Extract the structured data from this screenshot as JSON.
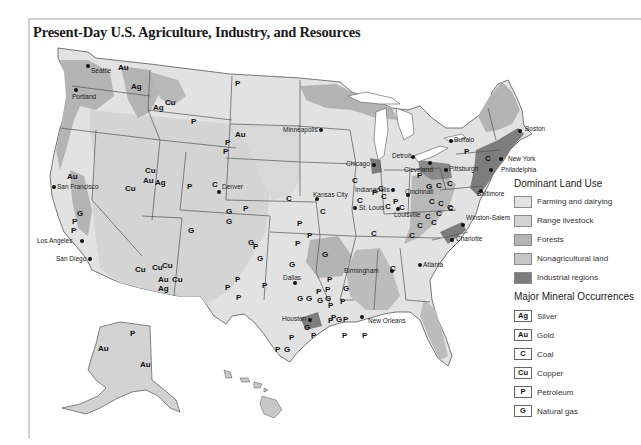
{
  "title": "Present-Day U.S. Agriculture, Industry, and Resources",
  "colors": {
    "farming": "#e2e2e2",
    "range": "#d4d4d4",
    "forests": "#b4b4b4",
    "nonag": "#c6c6c6",
    "industrial": "#7d7d7d",
    "border": "#555555",
    "water": "#ffffff"
  },
  "legend": {
    "land_use_title": "Dominant Land Use",
    "land_use": [
      {
        "label": "Farming and dairying",
        "color": "#e2e2e2"
      },
      {
        "label": "Range livestock",
        "color": "#d4d4d4"
      },
      {
        "label": "Forests",
        "color": "#b4b4b4"
      },
      {
        "label": "Nonagricultural land",
        "color": "#c6c6c6"
      },
      {
        "label": "Industrial regions",
        "color": "#7d7d7d"
      }
    ],
    "minerals_title": "Major Mineral Occurrences",
    "minerals": [
      {
        "symbol": "Ag",
        "label": "Silver"
      },
      {
        "symbol": "Au",
        "label": "Gold"
      },
      {
        "symbol": "C",
        "label": "Coal"
      },
      {
        "symbol": "Cu",
        "label": "Copper"
      },
      {
        "symbol": "P",
        "label": "Petroleum"
      },
      {
        "symbol": "G",
        "label": "Natural gas"
      }
    ]
  },
  "cities": [
    {
      "name": "Seattle",
      "x": 88,
      "y": 66,
      "dx": 3,
      "dy": 2
    },
    {
      "name": "Portland",
      "x": 76,
      "y": 90,
      "dx": -4,
      "dy": 4
    },
    {
      "name": "San Francisco",
      "x": 54,
      "y": 187,
      "dx": 3,
      "dy": -3
    },
    {
      "name": "Los Angeles",
      "x": 82,
      "y": 241,
      "dx": -45,
      "dy": -3
    },
    {
      "name": "San Diego",
      "x": 90,
      "y": 259,
      "dx": -34,
      "dy": -3
    },
    {
      "name": "Denver",
      "x": 219,
      "y": 192,
      "dx": 3,
      "dy": -8
    },
    {
      "name": "Minneapolis",
      "x": 321,
      "y": 130,
      "dx": -38,
      "dy": -3
    },
    {
      "name": "Chicago",
      "x": 374,
      "y": 165,
      "dx": -28,
      "dy": -4
    },
    {
      "name": "Detroit",
      "x": 413,
      "y": 157,
      "dx": -21,
      "dy": -4
    },
    {
      "name": "Buffalo",
      "x": 451,
      "y": 141,
      "dx": 3,
      "dy": -4
    },
    {
      "name": "Cleveland",
      "x": 430,
      "y": 163,
      "dx": -26,
      "dy": 4
    },
    {
      "name": "Pittsburgh",
      "x": 446,
      "y": 170,
      "dx": 3,
      "dy": -4
    },
    {
      "name": "Indianapolis",
      "x": 393,
      "y": 190,
      "dx": -38,
      "dy": -3
    },
    {
      "name": "Cincinnati",
      "x": 408,
      "y": 195,
      "dx": -3,
      "dy": -6
    },
    {
      "name": "St. Louis",
      "x": 355,
      "y": 208,
      "dx": 4,
      "dy": -3
    },
    {
      "name": "Kansas City",
      "x": 317,
      "y": 199,
      "dx": -4,
      "dy": -7
    },
    {
      "name": "Louisville",
      "x": 398,
      "y": 209,
      "dx": -4,
      "dy": 3
    },
    {
      "name": "Baltimore",
      "x": 481,
      "y": 191,
      "dx": -4,
      "dy": 0
    },
    {
      "name": "Philadelphia",
      "x": 491,
      "y": 170,
      "dx": 10,
      "dy": -3
    },
    {
      "name": "New York",
      "x": 501,
      "y": 159,
      "dx": 7,
      "dy": -3
    },
    {
      "name": "Boston",
      "x": 520,
      "y": 131,
      "dx": 5,
      "dy": -5
    },
    {
      "name": "Winston-Salem",
      "x": 463,
      "y": 225,
      "dx": 3,
      "dy": -10
    },
    {
      "name": "Charlotte",
      "x": 452,
      "y": 240,
      "dx": 4,
      "dy": -4
    },
    {
      "name": "Atlanta",
      "x": 420,
      "y": 265,
      "dx": 3,
      "dy": -3
    },
    {
      "name": "Birmingham",
      "x": 392,
      "y": 271,
      "dx": -48,
      "dy": -3
    },
    {
      "name": "Dallas",
      "x": 295,
      "y": 283,
      "dx": -12,
      "dy": -8
    },
    {
      "name": "Houston",
      "x": 310,
      "y": 320,
      "dx": -28,
      "dy": -4
    },
    {
      "name": "New Orleans",
      "x": 362,
      "y": 317,
      "dx": 6,
      "dy": 1
    }
  ],
  "minerals_on_map": [
    {
      "s": "Au",
      "x": 118,
      "y": 64
    },
    {
      "s": "Ag",
      "x": 131,
      "y": 83
    },
    {
      "s": "Cu",
      "x": 165,
      "y": 99
    },
    {
      "s": "Ag",
      "x": 153,
      "y": 104
    },
    {
      "s": "P",
      "x": 191,
      "y": 118
    },
    {
      "s": "P",
      "x": 235,
      "y": 80
    },
    {
      "s": "Au",
      "x": 235,
      "y": 131
    },
    {
      "s": "P",
      "x": 225,
      "y": 139
    },
    {
      "s": "P",
      "x": 223,
      "y": 148
    },
    {
      "s": "Au",
      "x": 67,
      "y": 173
    },
    {
      "s": "Cu",
      "x": 125,
      "y": 185
    },
    {
      "s": "Cu",
      "x": 145,
      "y": 167
    },
    {
      "s": "Au",
      "x": 143,
      "y": 177
    },
    {
      "s": "Ag",
      "x": 155,
      "y": 179
    },
    {
      "s": "P",
      "x": 187,
      "y": 183
    },
    {
      "s": "C",
      "x": 212,
      "y": 181
    },
    {
      "s": "G",
      "x": 77,
      "y": 210
    },
    {
      "s": "P",
      "x": 72,
      "y": 218
    },
    {
      "s": "P",
      "x": 71,
      "y": 227
    },
    {
      "s": "G",
      "x": 188,
      "y": 227
    },
    {
      "s": "Cu",
      "x": 135,
      "y": 266
    },
    {
      "s": "Cu",
      "x": 152,
      "y": 264
    },
    {
      "s": "Cu",
      "x": 162,
      "y": 262
    },
    {
      "s": "Au",
      "x": 158,
      "y": 276
    },
    {
      "s": "Ag",
      "x": 158,
      "y": 285
    },
    {
      "s": "Cu",
      "x": 172,
      "y": 276
    },
    {
      "s": "G",
      "x": 226,
      "y": 208
    },
    {
      "s": "G",
      "x": 226,
      "y": 218
    },
    {
      "s": "P",
      "x": 243,
      "y": 205
    },
    {
      "s": "C",
      "x": 286,
      "y": 195
    },
    {
      "s": "C",
      "x": 320,
      "y": 208
    },
    {
      "s": "P",
      "x": 297,
      "y": 220
    },
    {
      "s": "P",
      "x": 307,
      "y": 232
    },
    {
      "s": "P",
      "x": 295,
      "y": 240
    },
    {
      "s": "G",
      "x": 248,
      "y": 239
    },
    {
      "s": "P",
      "x": 253,
      "y": 243
    },
    {
      "s": "G",
      "x": 257,
      "y": 255
    },
    {
      "s": "G",
      "x": 289,
      "y": 261
    },
    {
      "s": "G",
      "x": 322,
      "y": 251
    },
    {
      "s": "P",
      "x": 235,
      "y": 276
    },
    {
      "s": "P",
      "x": 225,
      "y": 284
    },
    {
      "s": "P",
      "x": 236,
      "y": 294
    },
    {
      "s": "P",
      "x": 262,
      "y": 282
    },
    {
      "s": "P",
      "x": 327,
      "y": 276
    },
    {
      "s": "P",
      "x": 316,
      "y": 288
    },
    {
      "s": "P",
      "x": 325,
      "y": 286
    },
    {
      "s": "G",
      "x": 343,
      "y": 285
    },
    {
      "s": "G",
      "x": 317,
      "y": 297
    },
    {
      "s": "G",
      "x": 325,
      "y": 295
    },
    {
      "s": "P",
      "x": 328,
      "y": 302
    },
    {
      "s": "P",
      "x": 340,
      "y": 298
    },
    {
      "s": "G",
      "x": 297,
      "y": 295
    },
    {
      "s": "G",
      "x": 306,
      "y": 295
    },
    {
      "s": "P",
      "x": 328,
      "y": 317
    },
    {
      "s": "P",
      "x": 343,
      "y": 316
    },
    {
      "s": "G",
      "x": 336,
      "y": 316
    },
    {
      "s": "P",
      "x": 331,
      "y": 314
    },
    {
      "s": "G",
      "x": 304,
      "y": 324
    },
    {
      "s": "P",
      "x": 311,
      "y": 332
    },
    {
      "s": "P",
      "x": 289,
      "y": 334
    },
    {
      "s": "P",
      "x": 275,
      "y": 346
    },
    {
      "s": "G",
      "x": 284,
      "y": 346
    },
    {
      "s": "P",
      "x": 342,
      "y": 332
    },
    {
      "s": "P",
      "x": 362,
      "y": 332
    },
    {
      "s": "C",
      "x": 371,
      "y": 230
    },
    {
      "s": "C",
      "x": 352,
      "y": 177
    },
    {
      "s": "C",
      "x": 378,
      "y": 185
    },
    {
      "s": "C",
      "x": 381,
      "y": 193
    },
    {
      "s": "P",
      "x": 393,
      "y": 198
    },
    {
      "s": "C",
      "x": 399,
      "y": 204
    },
    {
      "s": "C",
      "x": 357,
      "y": 197
    },
    {
      "s": "P",
      "x": 372,
      "y": 189
    },
    {
      "s": "C",
      "x": 385,
      "y": 203
    },
    {
      "s": "P",
      "x": 417,
      "y": 172
    },
    {
      "s": "P",
      "x": 464,
      "y": 148
    },
    {
      "s": "C",
      "x": 485,
      "y": 155
    },
    {
      "s": "G",
      "x": 426,
      "y": 183
    },
    {
      "s": "C",
      "x": 436,
      "y": 182
    },
    {
      "s": "C",
      "x": 447,
      "y": 180
    },
    {
      "s": "C",
      "x": 429,
      "y": 198
    },
    {
      "s": "C",
      "x": 438,
      "y": 200
    },
    {
      "s": "C",
      "x": 448,
      "y": 205
    },
    {
      "s": "C",
      "x": 425,
      "y": 213
    },
    {
      "s": "C",
      "x": 436,
      "y": 210
    },
    {
      "s": "C",
      "x": 447,
      "y": 204
    },
    {
      "s": "C",
      "x": 417,
      "y": 222
    },
    {
      "s": "C",
      "x": 431,
      "y": 219
    },
    {
      "s": "C",
      "x": 409,
      "y": 232
    },
    {
      "s": "C",
      "x": 390,
      "y": 265
    },
    {
      "s": "P",
      "x": 130,
      "y": 330
    },
    {
      "s": "Au",
      "x": 98,
      "y": 345
    },
    {
      "s": "Au",
      "x": 140,
      "y": 361
    }
  ]
}
